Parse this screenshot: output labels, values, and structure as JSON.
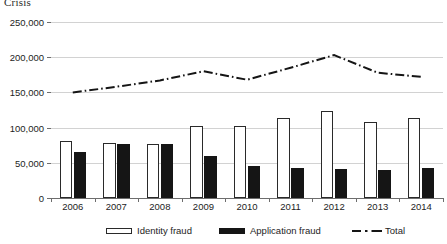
{
  "title": "Crisis",
  "chart_data": {
    "type": "bar",
    "title": "Crisis",
    "xlabel": "",
    "ylabel": "",
    "grid": true,
    "legend_position": "bottom",
    "ylim": [
      0,
      250000
    ],
    "yticks": [
      0,
      50000,
      100000,
      150000,
      200000,
      250000
    ],
    "ytick_labels": [
      "0",
      "50,000",
      "100,000",
      "150,000",
      "200,000",
      "250,000"
    ],
    "categories": [
      "2006",
      "2007",
      "2008",
      "2009",
      "2010",
      "2011",
      "2012",
      "2013",
      "2014"
    ],
    "series": [
      {
        "name": "Identity fraud",
        "type": "bar",
        "color": "#ffffff",
        "edge_color": "#2a2a2a",
        "values": [
          81000,
          78000,
          77000,
          102000,
          102000,
          114000,
          123000,
          108000,
          114000
        ]
      },
      {
        "name": "Application fraud",
        "type": "bar",
        "color": "#151515",
        "edge_color": "#151515",
        "values": [
          65000,
          77000,
          77000,
          59000,
          45000,
          43000,
          41000,
          40000,
          43000
        ]
      },
      {
        "name": "Total",
        "type": "line",
        "style": "dash-dot",
        "color": "#151515",
        "values": [
          150000,
          158000,
          167000,
          180000,
          168000,
          185000,
          203000,
          178000,
          172000
        ]
      }
    ]
  },
  "legend": {
    "items": [
      {
        "label": "Identity fraud",
        "marker": "open-bar-swatch"
      },
      {
        "label": "Application fraud",
        "marker": "filled-bar-swatch"
      },
      {
        "label": "Total",
        "marker": "dash-dot-line-swatch"
      }
    ]
  }
}
